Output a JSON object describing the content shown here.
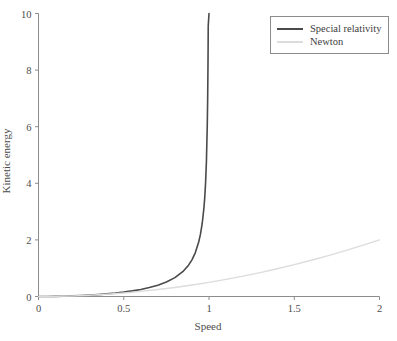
{
  "chart_data": {
    "type": "line",
    "title": "",
    "subtitle": "",
    "xlabel": "Speed",
    "ylabel": "Kinetic energy",
    "xlim": [
      0,
      2
    ],
    "ylim": [
      0,
      10
    ],
    "xticks": [
      "0",
      "0.5",
      "1",
      "1.5",
      "2"
    ],
    "xtick_values": [
      0,
      0.5,
      1,
      1.5,
      2
    ],
    "yticks": [
      "0",
      "2",
      "4",
      "6",
      "8",
      "10"
    ],
    "ytick_values": [
      0,
      2,
      4,
      6,
      8,
      10
    ],
    "grid": false,
    "legend_position": "top-right",
    "annotations": [],
    "series": [
      {
        "name": "Special relativity",
        "color": "#4a4a4a",
        "linewidth": 1.6,
        "formula": "1/sqrt(1 - v^2) - 1",
        "asymptote_x": 1,
        "x": [
          0,
          0.05,
          0.1,
          0.15,
          0.2,
          0.25,
          0.3,
          0.35,
          0.4,
          0.45,
          0.5,
          0.55,
          0.6,
          0.65,
          0.7,
          0.75,
          0.8,
          0.85,
          0.88,
          0.9,
          0.92,
          0.94,
          0.95,
          0.96,
          0.97,
          0.975,
          0.98,
          0.985,
          0.99,
          0.992,
          0.994,
          0.995,
          0.9955
        ],
        "values": [
          0,
          0.00125,
          0.00504,
          0.01144,
          0.0206,
          0.0328,
          0.0483,
          0.0678,
          0.0911,
          0.1194,
          0.1547,
          0.1976,
          0.25,
          0.3159,
          0.4003,
          0.5119,
          0.6667,
          0.898,
          1.1067,
          1.2942,
          1.5521,
          1.9333,
          2.2026,
          2.5714,
          3.1144,
          3.5,
          4.0252,
          4.7851,
          6.0888,
          6.9285,
          8.1462,
          9.0125,
          9.5541
        ]
      },
      {
        "name": "Newton",
        "color": "#dcdcdc",
        "linewidth": 1.4,
        "formula": "v^2/2",
        "x": [
          0,
          0.1,
          0.2,
          0.3,
          0.4,
          0.5,
          0.6,
          0.7,
          0.8,
          0.9,
          1,
          1.1,
          1.2,
          1.3,
          1.4,
          1.5,
          1.6,
          1.7,
          1.8,
          1.9,
          2
        ],
        "values": [
          0,
          0.005,
          0.02,
          0.045,
          0.08,
          0.125,
          0.18,
          0.245,
          0.32,
          0.405,
          0.5,
          0.605,
          0.72,
          0.845,
          0.98,
          1.125,
          1.28,
          1.445,
          1.62,
          1.805,
          2
        ]
      }
    ]
  },
  "legend": {
    "entries": [
      {
        "label": "Special relativity",
        "color": "#4a4a4a"
      },
      {
        "label": "Newton",
        "color": "#dcdcdc"
      }
    ]
  },
  "axes": {
    "axis_color": "#8c8c8c",
    "tick_color": "#8c8c8c",
    "text_color": "#4d4d4d"
  }
}
